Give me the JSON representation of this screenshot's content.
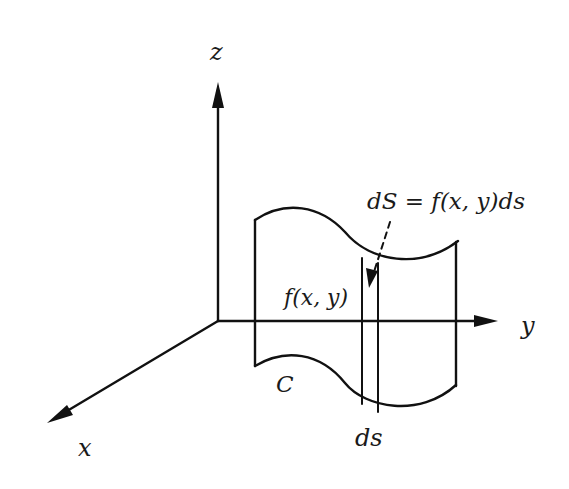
{
  "diagram": {
    "axes": {
      "z_label": "z",
      "y_label": "y",
      "x_label": "x"
    },
    "labels": {
      "area_element": "dS = f(x, y)ds",
      "height": "f(x, y)",
      "curve": "C",
      "arc_element": "ds"
    },
    "colors": {
      "line": "#111111",
      "text": "#1a1a1a",
      "background": "#ffffff"
    }
  }
}
